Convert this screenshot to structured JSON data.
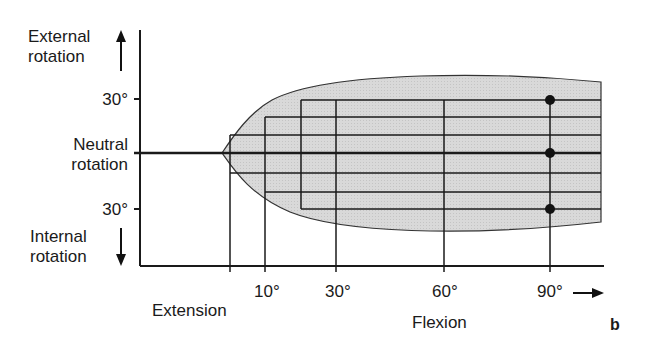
{
  "figure_label": "b",
  "y_axis": {
    "top_label_line1": "External",
    "top_label_line2": "rotation",
    "middle_label_line1": "Neutral",
    "middle_label_line2": "rotation",
    "bottom_label_line1": "Internal",
    "bottom_label_line2": "rotation",
    "ticks": [
      "30°",
      "30°"
    ]
  },
  "x_axis": {
    "left_label": "Extension",
    "right_label": "Flexion",
    "ticks": [
      "10°",
      "30°",
      "60°",
      "90°"
    ]
  },
  "colors": {
    "envelope_fill": "#d6d6d6",
    "line": "#1a1a1a",
    "background": "#ffffff"
  },
  "markers": [
    {
      "flexion": "90°",
      "rotation": "30° external"
    },
    {
      "flexion": "90°",
      "rotation": "neutral"
    },
    {
      "flexion": "90°",
      "rotation": "30° internal"
    }
  ]
}
